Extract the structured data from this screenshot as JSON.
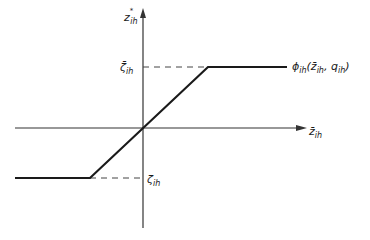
{
  "diagram": {
    "type": "piecewise-linear saturation function",
    "y_axis_label": {
      "base": "z",
      "sup": "*",
      "sub": "ih"
    },
    "x_axis_label": {
      "base": "z̄",
      "sub": "ih"
    },
    "upper_bound_label": {
      "base": "ζ̄",
      "sub": "ih"
    },
    "lower_bound_label": {
      "base": "ζ",
      "sub": "ih"
    },
    "function_label": {
      "base": "ϕ",
      "sub": "ih",
      "args_open": "(",
      "arg1": "z̄",
      "arg1_sub": "ih",
      "sep": ", ",
      "arg2": "q",
      "arg2_sub": "ih",
      "args_close": ")"
    },
    "colors": {
      "line": "#1a1a1a",
      "axis": "#333333",
      "dash": "#444444",
      "background": "#ffffff"
    }
  }
}
